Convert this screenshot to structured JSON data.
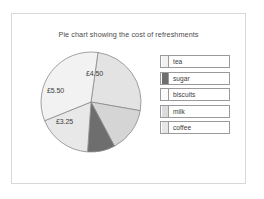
{
  "chart_data": {
    "type": "pie",
    "title": "Pie chart showing the cost of refreshments",
    "categories": [
      "tea",
      "sugar",
      "biscuits",
      "milk",
      "coffee"
    ],
    "values": [
      4.5,
      1.5,
      5.5,
      3.25,
      3.0
    ],
    "value_labels": [
      "£4.50",
      "",
      "£5.50",
      "£3.25",
      ""
    ],
    "visible_labels": [
      "£4.50",
      "£5.50",
      "£3.25"
    ],
    "currency": "£",
    "legend_position": "right",
    "grid": false,
    "colors": {
      "tea": "#e3e3e3",
      "sugar": "#6e6e6e",
      "biscuits": "#f2f2f2",
      "milk": "#e8e8e8",
      "coffee": "#d5d5d5",
      "outline": "#8a8a8a",
      "frame_border": "#d8d8d8",
      "text": "#3c3c3c",
      "background": "#ffffff"
    },
    "slices": [
      {
        "name": "tea",
        "label": "£4.50",
        "start_deg": 8,
        "end_deg": 100,
        "fill": "#e3e3e3",
        "label_x": 47,
        "label_y": 20
      },
      {
        "name": "coffee",
        "label": "",
        "start_deg": 100,
        "end_deg": 152,
        "fill": "#d5d5d5",
        "label_x": 0,
        "label_y": 0
      },
      {
        "name": "sugar",
        "label": "",
        "start_deg": 152,
        "end_deg": 184,
        "fill": "#6e6e6e",
        "label_x": 0,
        "label_y": 0
      },
      {
        "name": "milk",
        "label": "£3.25",
        "start_deg": 184,
        "end_deg": 248,
        "fill": "#e8e8e8",
        "label_x": 17,
        "label_y": 68
      },
      {
        "name": "biscuits",
        "label": "£5.50",
        "start_deg": 248,
        "end_deg": 368,
        "fill": "#f2f2f2",
        "label_x": 8,
        "label_y": 37
      }
    ]
  },
  "legend": {
    "items": [
      {
        "label": "tea",
        "swatch": "#f2f2f2"
      },
      {
        "label": "sugar",
        "swatch": "#6e6e6e"
      },
      {
        "label": "biscuits",
        "swatch": "#fbfbfb"
      },
      {
        "label": "milk",
        "swatch": "#dcdcdc"
      },
      {
        "label": "coffee",
        "swatch": "#e6e6e6"
      }
    ]
  }
}
